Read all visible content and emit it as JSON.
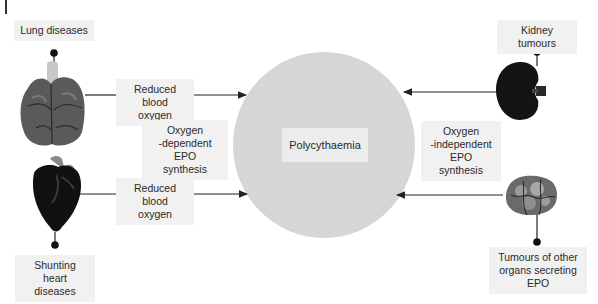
{
  "diagram": {
    "center": {
      "label": "Polycythaemia",
      "color": "#d6d6d6"
    },
    "causes": [
      {
        "id": "lung",
        "label": "Lung diseases",
        "icon": "lungs-icon",
        "side": "left",
        "position": "top"
      },
      {
        "id": "heart",
        "label": "Shunting heart diseases",
        "icon": "heart-icon",
        "side": "left",
        "position": "bottom"
      },
      {
        "id": "kidney",
        "label": "Kidney tumours",
        "icon": "kidney-icon",
        "side": "right",
        "position": "top"
      },
      {
        "id": "other",
        "label": "Tumours of other organs secreting EPO",
        "icon": "tumour-icon",
        "side": "right",
        "position": "bottom"
      }
    ],
    "edge_labels": {
      "lung_edge": "Reduced blood oxygen",
      "heart_edge": "Reduced blood oxygen"
    },
    "mechanisms": {
      "left": "Oxygen -dependent EPO synthesis",
      "right": "Oxygen -independent EPO synthesis"
    },
    "text": {
      "lung_label": "Lung diseases",
      "heart_label_1": "Shunting heart",
      "heart_label_2": "diseases",
      "kidney_label": "Kidney tumours",
      "other_label_1": "Tumours of other",
      "other_label_2": "organs secreting",
      "other_label_3": "EPO",
      "edge1_line1": "Reduced blood",
      "edge1_line2": "oxygen",
      "edge2_line1": "Reduced blood",
      "edge2_line2": "oxygen",
      "left_mech_1": "Oxygen",
      "left_mech_2": "-dependent EPO",
      "left_mech_3": "synthesis",
      "right_mech_1": "Oxygen",
      "right_mech_2": "-independent",
      "right_mech_3": "EPO synthesis",
      "center": "Polycythaemia"
    }
  }
}
